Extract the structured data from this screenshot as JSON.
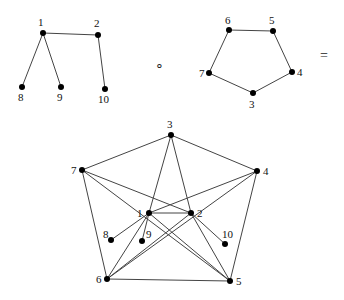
{
  "graphs": [
    {
      "name": "tree-graph",
      "nodes": [
        {
          "id": "1",
          "x": 43,
          "y": 33,
          "lx": 38,
          "ly": 26
        },
        {
          "id": "2",
          "x": 98,
          "y": 35,
          "lx": 94,
          "ly": 27
        },
        {
          "id": "8",
          "x": 22,
          "y": 87,
          "lx": 18,
          "ly": 101
        },
        {
          "id": "9",
          "x": 61,
          "y": 87,
          "lx": 57,
          "ly": 101
        },
        {
          "id": "10",
          "x": 105,
          "y": 89,
          "lx": 98,
          "ly": 103
        }
      ],
      "edges": [
        [
          "1",
          "2"
        ],
        [
          "1",
          "8"
        ],
        [
          "1",
          "9"
        ],
        [
          "2",
          "10"
        ]
      ]
    },
    {
      "name": "pentagon-graph",
      "nodes": [
        {
          "id": "6",
          "x": 229,
          "y": 30,
          "lx": 225,
          "ly": 24
        },
        {
          "id": "5",
          "x": 273,
          "y": 31,
          "lx": 269,
          "ly": 24
        },
        {
          "id": "4",
          "x": 292,
          "y": 72,
          "lx": 297,
          "ly": 76
        },
        {
          "id": "3",
          "x": 253,
          "y": 93,
          "lx": 249,
          "ly": 108
        },
        {
          "id": "7",
          "x": 209,
          "y": 73,
          "lx": 199,
          "ly": 77
        }
      ],
      "edges": [
        [
          "6",
          "5"
        ],
        [
          "5",
          "4"
        ],
        [
          "4",
          "3"
        ],
        [
          "3",
          "7"
        ],
        [
          "7",
          "6"
        ]
      ]
    },
    {
      "name": "composition-graph",
      "nodes": [
        {
          "id": "3",
          "x": 171,
          "y": 135,
          "lx": 167,
          "ly": 128
        },
        {
          "id": "7",
          "x": 82,
          "y": 170,
          "lx": 71,
          "ly": 174
        },
        {
          "id": "4",
          "x": 257,
          "y": 171,
          "lx": 263,
          "ly": 175
        },
        {
          "id": "1",
          "x": 149,
          "y": 213,
          "lx": 137,
          "ly": 217
        },
        {
          "id": "2",
          "x": 191,
          "y": 213,
          "lx": 197,
          "ly": 217
        },
        {
          "id": "8",
          "x": 111,
          "y": 240,
          "lx": 103,
          "ly": 238
        },
        {
          "id": "9",
          "x": 142,
          "y": 241,
          "lx": 146,
          "ly": 238
        },
        {
          "id": "10",
          "x": 225,
          "y": 244,
          "lx": 222,
          "ly": 238
        },
        {
          "id": "6",
          "x": 107,
          "y": 279,
          "lx": 96,
          "ly": 283
        },
        {
          "id": "5",
          "x": 230,
          "y": 281,
          "lx": 236,
          "ly": 285
        }
      ],
      "edges": [
        [
          "3",
          "7"
        ],
        [
          "3",
          "4"
        ],
        [
          "3",
          "1"
        ],
        [
          "3",
          "2"
        ],
        [
          "7",
          "6"
        ],
        [
          "7",
          "2"
        ],
        [
          "7",
          "5"
        ],
        [
          "4",
          "5"
        ],
        [
          "4",
          "1"
        ],
        [
          "4",
          "6"
        ],
        [
          "1",
          "2"
        ],
        [
          "1",
          "8"
        ],
        [
          "1",
          "9"
        ],
        [
          "1",
          "6"
        ],
        [
          "1",
          "5"
        ],
        [
          "2",
          "6"
        ],
        [
          "2",
          "5"
        ],
        [
          "2",
          "10"
        ],
        [
          "6",
          "5"
        ]
      ]
    }
  ],
  "operators": [
    {
      "name": "composition-operator",
      "symbol": "∘",
      "x": 155,
      "y": 70
    },
    {
      "name": "equals-operator",
      "symbol": "=",
      "x": 320,
      "y": 60
    }
  ]
}
